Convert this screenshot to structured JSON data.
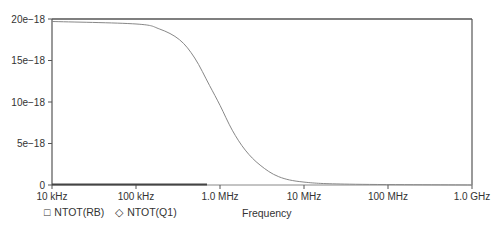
{
  "chart_data": {
    "type": "line",
    "title": "",
    "xlabel": "Frequency",
    "ylabel": "",
    "x_scale": "log",
    "xlim": [
      10000,
      1000000000
    ],
    "ylim": [
      0,
      2e-17
    ],
    "x_ticks": [
      "10 kHz",
      "100 kHz",
      "1.0 MHz",
      "10 MHz",
      "100 MHz",
      "1.0 GHz"
    ],
    "y_ticks": [
      "0",
      "5e−18",
      "10e−18",
      "15e−18",
      "20e−18"
    ],
    "grid": false,
    "legend_position": "bottom-left",
    "series": [
      {
        "name": "NTOT(RB)",
        "marker": "square",
        "x": [
          10000,
          700000
        ],
        "values": [
          0.0,
          0.0
        ]
      },
      {
        "name": "NTOT(Q1)",
        "marker": "diamond",
        "x": [
          10000,
          100000,
          190000,
          330000,
          500000,
          750000,
          1000000,
          1400000,
          2000000,
          3000000,
          5000000,
          10000000,
          35000000,
          1000000000
        ],
        "values": [
          1.97e-17,
          1.94e-17,
          1.88e-17,
          1.75e-17,
          1.53e-17,
          1.2e-17,
          9.6e-18,
          6.6e-18,
          4.2e-18,
          2.4e-18,
          1e-18,
          3.5e-19,
          1e-19,
          0.0
        ]
      }
    ]
  },
  "legend": {
    "items": [
      {
        "symbol": "□",
        "label": "NTOT(RB)"
      },
      {
        "symbol": "◇",
        "label": "NTOT(Q1)"
      }
    ]
  },
  "axis": {
    "xlabel": "Frequency"
  }
}
